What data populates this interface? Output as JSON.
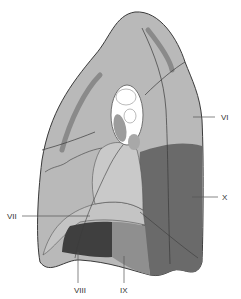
{
  "diagram": {
    "colors": {
      "background": "#ffffff",
      "lobe_base": "#b9b9b9",
      "light_segment": "#c9c9c9",
      "segment_vii": "#c4c4c4",
      "segment_viii": "#3f3f3f",
      "segment_ix": "#8f8f8f",
      "segment_x": "#6a6a6a",
      "hilum": "#ffffff",
      "outline": "#3a3a3a"
    },
    "labels": [
      {
        "id": "VI",
        "text": "VI"
      },
      {
        "id": "VII",
        "text": "VII"
      },
      {
        "id": "VIII",
        "text": "VIII"
      },
      {
        "id": "IX",
        "text": "IX"
      },
      {
        "id": "X",
        "text": "X"
      }
    ]
  }
}
